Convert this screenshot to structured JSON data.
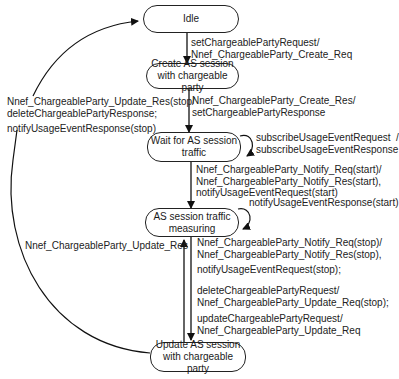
{
  "diagram": {
    "type": "state-machine",
    "states": [
      {
        "id": "idle",
        "label": "Idle"
      },
      {
        "id": "create",
        "label": "Create AS session\nwith chargeable party"
      },
      {
        "id": "wait",
        "label": "Wait for AS session\ntraffic"
      },
      {
        "id": "measuring",
        "label": "AS session traffic\nmeasuring"
      },
      {
        "id": "update",
        "label": "Update AS session\nwith chargeable party"
      }
    ],
    "transitions": [
      {
        "from": "idle",
        "to": "create",
        "label": "setChargeablePartyRequest/\nNnef_ChargeableParty_Create_Req"
      },
      {
        "from": "create",
        "to": "wait",
        "label": "Nnef_ChargeableParty_Create_Res/\nsetChargeablePartyResponse"
      },
      {
        "from": "wait",
        "to": "wait",
        "label": "subscribeUsageEventRequest  /\nsubscribeUsageEventResponse"
      },
      {
        "from": "wait",
        "to": "measuring",
        "label": "Nnef_ChargeableParty_Notify_Req(start)/\nNnef_ChargeableParty_Notify_Res(start),\nnotifyUsageEventRequest(start)"
      },
      {
        "from": "measuring",
        "to": "measuring",
        "label": "notifyUsageEventResponse(start)"
      },
      {
        "from": "measuring",
        "to": "update",
        "label_parts": [
          "Nnef_ChargeableParty_Notify_Req(stop)/\nNnef_ChargeableParty_Notify_Res(stop),",
          "notifyUsageEventRequest(stop);",
          "deleteChargeablePartyRequest/\nNnef_ChargeableParty_Update_Req(stop);",
          "updateChargeablePartyRequest/\nNnef_ChargeableParty_Update_Req"
        ]
      },
      {
        "from": "update",
        "to": "measuring",
        "label": "Nnef_ChargeableParty_Update_Res"
      },
      {
        "from": "update",
        "to": "idle",
        "label_parts": [
          "Nnef_ChargeableParty_Update_Res(stop/\ndeleteChargeablePartyResponse;",
          "notifyUsageEventResponse(stop)"
        ]
      }
    ]
  }
}
